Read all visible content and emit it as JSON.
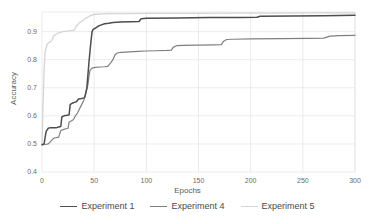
{
  "chart_data": {
    "type": "line",
    "title": "",
    "xlabel": "Epochs",
    "ylabel": "Accuracy",
    "xlim": [
      0,
      300
    ],
    "ylim": [
      0.4,
      0.97
    ],
    "xticks": [
      0,
      50,
      100,
      150,
      200,
      250,
      300
    ],
    "yticks": [
      0.4,
      0.5,
      0.6,
      0.7,
      0.8,
      0.9
    ],
    "xtick_labels": [
      "0",
      "50",
      "100",
      "150",
      "200",
      "250",
      "300"
    ],
    "ytick_labels": [
      "0.4",
      "0.5",
      "0.6",
      "0.7",
      "0.8",
      "0.9"
    ],
    "grid": true,
    "legend_position": "bottom",
    "series": [
      {
        "name": "Experiment 1",
        "color": "#4d4d4d",
        "width": 1.5,
        "points": [
          [
            0,
            0.497
          ],
          [
            2,
            0.5
          ],
          [
            3,
            0.523
          ],
          [
            4,
            0.545
          ],
          [
            6,
            0.556
          ],
          [
            8,
            0.558
          ],
          [
            14,
            0.558
          ],
          [
            16,
            0.56
          ],
          [
            18,
            0.562
          ],
          [
            19,
            0.596
          ],
          [
            21,
            0.6
          ],
          [
            24,
            0.602
          ],
          [
            26,
            0.604
          ],
          [
            27,
            0.64
          ],
          [
            29,
            0.645
          ],
          [
            31,
            0.648
          ],
          [
            33,
            0.65
          ],
          [
            35,
            0.66
          ],
          [
            38,
            0.662
          ],
          [
            40,
            0.664
          ],
          [
            41,
            0.666
          ],
          [
            43,
            0.7
          ],
          [
            44,
            0.745
          ],
          [
            45,
            0.79
          ],
          [
            46,
            0.83
          ],
          [
            47,
            0.868
          ],
          [
            48,
            0.9
          ],
          [
            49,
            0.908
          ],
          [
            51,
            0.912
          ],
          [
            54,
            0.92
          ],
          [
            57,
            0.924
          ],
          [
            60,
            0.928
          ],
          [
            64,
            0.93
          ],
          [
            68,
            0.933
          ],
          [
            75,
            0.934
          ],
          [
            85,
            0.935
          ],
          [
            93,
            0.936
          ],
          [
            95,
            0.946
          ],
          [
            100,
            0.948
          ],
          [
            130,
            0.949
          ],
          [
            160,
            0.95
          ],
          [
            190,
            0.95
          ],
          [
            206,
            0.951
          ],
          [
            209,
            0.955
          ],
          [
            240,
            0.956
          ],
          [
            270,
            0.957
          ],
          [
            300,
            0.958
          ]
        ]
      },
      {
        "name": "Experiment 4",
        "color": "#808080",
        "width": 1.2,
        "points": [
          [
            0,
            0.497
          ],
          [
            3,
            0.498
          ],
          [
            6,
            0.5
          ],
          [
            9,
            0.512
          ],
          [
            11,
            0.52
          ],
          [
            13,
            0.522
          ],
          [
            16,
            0.524
          ],
          [
            18,
            0.548
          ],
          [
            21,
            0.552
          ],
          [
            23,
            0.554
          ],
          [
            25,
            0.556
          ],
          [
            26,
            0.578
          ],
          [
            28,
            0.582
          ],
          [
            30,
            0.586
          ],
          [
            32,
            0.6
          ],
          [
            34,
            0.61
          ],
          [
            36,
            0.625
          ],
          [
            38,
            0.64
          ],
          [
            40,
            0.655
          ],
          [
            42,
            0.68
          ],
          [
            44,
            0.71
          ],
          [
            45,
            0.74
          ],
          [
            46,
            0.762
          ],
          [
            48,
            0.77
          ],
          [
            51,
            0.773
          ],
          [
            56,
            0.774
          ],
          [
            60,
            0.775
          ],
          [
            63,
            0.776
          ],
          [
            66,
            0.79
          ],
          [
            68,
            0.8
          ],
          [
            70,
            0.818
          ],
          [
            72,
            0.824
          ],
          [
            76,
            0.826
          ],
          [
            84,
            0.828
          ],
          [
            92,
            0.83
          ],
          [
            100,
            0.831
          ],
          [
            110,
            0.832
          ],
          [
            120,
            0.833
          ],
          [
            124,
            0.834
          ],
          [
            126,
            0.845
          ],
          [
            129,
            0.85
          ],
          [
            135,
            0.851
          ],
          [
            150,
            0.852
          ],
          [
            165,
            0.853
          ],
          [
            172,
            0.854
          ],
          [
            174,
            0.866
          ],
          [
            177,
            0.872
          ],
          [
            183,
            0.873
          ],
          [
            200,
            0.874
          ],
          [
            230,
            0.875
          ],
          [
            255,
            0.876
          ],
          [
            270,
            0.877
          ],
          [
            276,
            0.884
          ],
          [
            285,
            0.886
          ],
          [
            300,
            0.887
          ]
        ]
      },
      {
        "name": "Experiment 5",
        "color": "#d4d4d4",
        "width": 1.3,
        "points": [
          [
            0,
            0.497
          ],
          [
            1,
            0.64
          ],
          [
            2,
            0.76
          ],
          [
            3,
            0.83
          ],
          [
            5,
            0.856
          ],
          [
            7,
            0.862
          ],
          [
            9,
            0.866
          ],
          [
            11,
            0.884
          ],
          [
            13,
            0.89
          ],
          [
            16,
            0.896
          ],
          [
            20,
            0.9
          ],
          [
            24,
            0.902
          ],
          [
            28,
            0.904
          ],
          [
            31,
            0.906
          ],
          [
            33,
            0.92
          ],
          [
            36,
            0.932
          ],
          [
            39,
            0.94
          ],
          [
            42,
            0.948
          ],
          [
            45,
            0.954
          ],
          [
            48,
            0.96
          ],
          [
            52,
            0.962
          ],
          [
            58,
            0.963
          ],
          [
            66,
            0.964
          ],
          [
            80,
            0.964
          ],
          [
            100,
            0.965
          ],
          [
            140,
            0.965
          ],
          [
            180,
            0.966
          ],
          [
            220,
            0.966
          ],
          [
            260,
            0.967
          ],
          [
            300,
            0.967
          ]
        ]
      }
    ]
  },
  "axis": {
    "grid_color": "#e3e3e3",
    "tick_text_color": "#6b6b6b",
    "label_text_color": "#5a5a5a"
  },
  "legend": {
    "items": [
      {
        "label": "Experiment 1",
        "color": "#4d4d4d"
      },
      {
        "label": "Experiment 4",
        "color": "#808080"
      },
      {
        "label": "Experiment 5",
        "color": "#d4d4d4"
      }
    ]
  }
}
